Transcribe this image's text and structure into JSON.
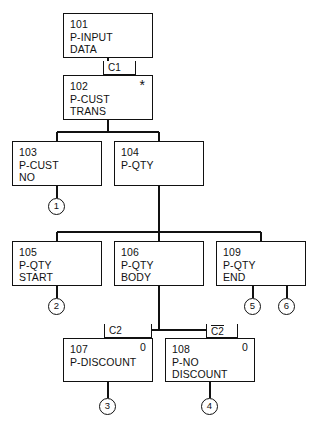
{
  "diagram": {
    "line_color": "#111111",
    "background_color": "#ffffff"
  },
  "boxes": [
    {
      "id": "101",
      "name": "P-INPUT\nDATA",
      "marker": "",
      "x": 63,
      "y": 13,
      "w": 90,
      "h": 45
    },
    {
      "id": "102",
      "name": "P-CUST\nTRANS",
      "marker": "*",
      "x": 63,
      "y": 75,
      "w": 90,
      "h": 45
    },
    {
      "id": "103",
      "name": "P-CUST\nNO",
      "marker": "",
      "x": 12,
      "y": 141,
      "w": 90,
      "h": 45
    },
    {
      "id": "104",
      "name": "P-QTY",
      "marker": "",
      "x": 114,
      "y": 141,
      "w": 90,
      "h": 45
    },
    {
      "id": "105",
      "name": "P-QTY\nSTART",
      "marker": "",
      "x": 12,
      "y": 241,
      "w": 90,
      "h": 45
    },
    {
      "id": "106",
      "name": "P-QTY\nBODY",
      "marker": "",
      "x": 114,
      "y": 241,
      "w": 90,
      "h": 45
    },
    {
      "id": "109",
      "name": "P-QTY\nEND",
      "marker": "",
      "x": 216,
      "y": 241,
      "w": 90,
      "h": 45
    },
    {
      "id": "107",
      "name": "P-DISCOUNT",
      "marker": "0",
      "x": 63,
      "y": 338,
      "w": 90,
      "h": 44
    },
    {
      "id": "108",
      "name": "P-NO\nDISCOUNT",
      "marker": "0",
      "x": 165,
      "y": 338,
      "w": 90,
      "h": 44
    }
  ],
  "conditions": [
    {
      "label": "C1",
      "negated": false,
      "x": 103,
      "y": 61,
      "w": 33
    },
    {
      "label": "C2",
      "negated": false,
      "x": 104,
      "y": 324,
      "w": 48
    },
    {
      "label": "C2",
      "negated": true,
      "x": 206,
      "y": 324,
      "w": 32
    }
  ],
  "connectors": [
    {
      "label": "1",
      "x": 48,
      "y": 198
    },
    {
      "label": "2",
      "x": 48,
      "y": 298
    },
    {
      "label": "3",
      "x": 99,
      "y": 398
    },
    {
      "label": "4",
      "x": 201,
      "y": 398
    },
    {
      "label": "5",
      "x": 244,
      "y": 298
    },
    {
      "label": "6",
      "x": 278,
      "y": 298
    }
  ],
  "edges": {
    "box101_to_box102": "vertical from 101 bottom to 102 top at x=108",
    "box102_to_row2_bus": "vertical from 102 bottom down to bus y=132",
    "row2_bus": "horizontal bus y=132 from x=57 to x=159",
    "bus_to_box103": "vertical drop at x=57 into box 103 top",
    "bus_to_box104": "vertical drop at x=159 into box 104 top",
    "box103_to_conn1": "vertical from 103 bottom to circle 1 at x=57",
    "box104_to_row3_bus": "vertical from 104 bottom down to bus y=232 at x=159",
    "row3_bus": "horizontal bus y=232 from x=57 to x=261",
    "bus_to_box105": "vertical drop at x=57 into box 105 top",
    "bus_to_box106": "vertical drop at x=159 into box 106 top",
    "bus_to_box109": "vertical drop at x=261 into box 109 top",
    "box105_to_conn2": "vertical from 105 bottom to circle 2 at x=57",
    "box109_to_conn5": "vertical from 109 bottom to circle 5 at x=253",
    "box109_to_conn6": "vertical from 109 bottom to circle 6 at x=287",
    "box106_to_row4_bus": "vertical from 106 bottom down to bus y=330 at x=159",
    "row4_bus": "horizontal bus y=330 from x=108 to x=210",
    "bus_to_box107": "vertical drop at x=108 into box 107 top",
    "bus_to_box108": "vertical drop at x=210 into box 108 top",
    "box107_to_conn3": "vertical from 107 bottom to circle 3 at x=108",
    "box108_to_conn4": "vertical from 108 bottom to circle 4 at x=210"
  }
}
